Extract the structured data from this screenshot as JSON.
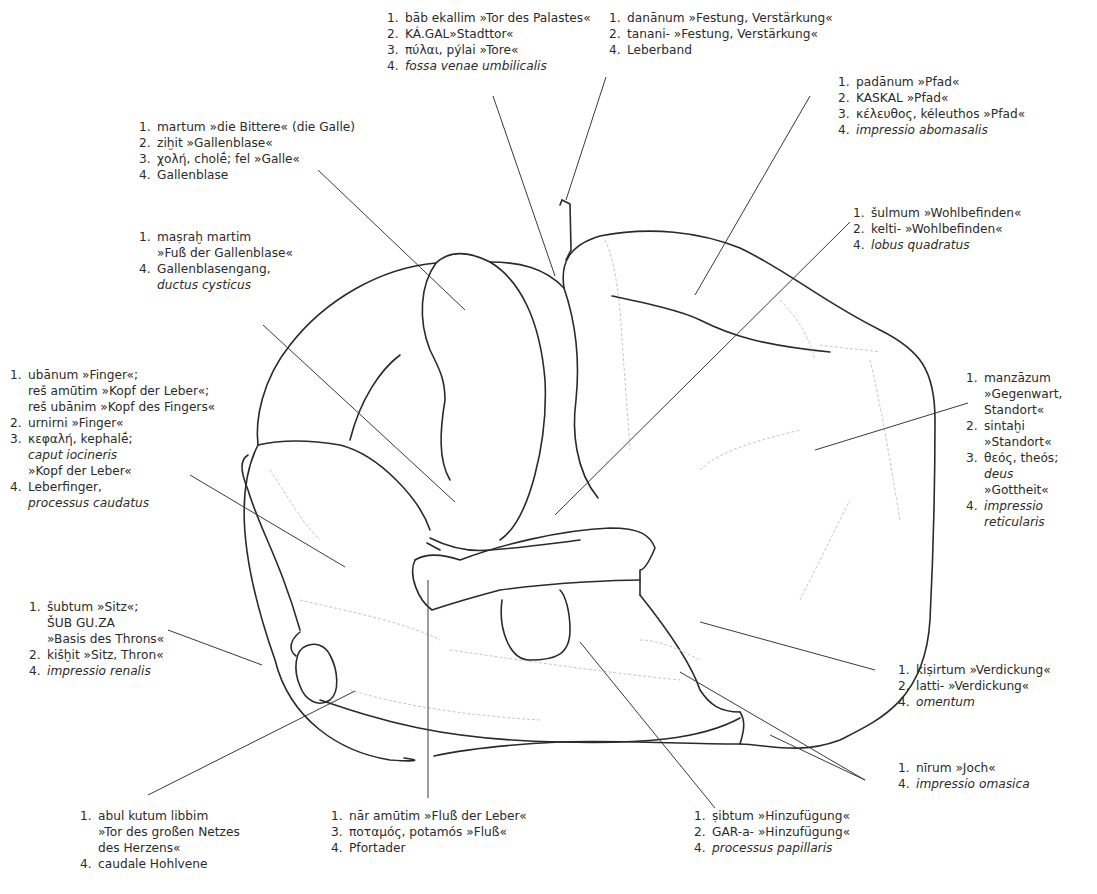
{
  "figure": {
    "line_color": "#2a2a2a",
    "leader_color": "#3a3a3a",
    "faint_color": "#bdbdbd"
  },
  "labels": {
    "tor_des_palastes": {
      "lines": [
        {
          "n": "1.",
          "t": "bāb ekallim »Tor des Palastes«"
        },
        {
          "n": "2.",
          "t": "KÁ.GAL»Stadttor«"
        },
        {
          "n": "3.",
          "t": "πύλαι, pýlai »Tore«"
        },
        {
          "n": "4.",
          "t": "fossa venae umbilicalis",
          "italic": true
        }
      ]
    },
    "festung": {
      "lines": [
        {
          "n": "1.",
          "t": "danānum »Festung, Verstärkung«"
        },
        {
          "n": "2.",
          "t": "tanani- »Festung, Verstärkung«"
        },
        {
          "n": "4.",
          "t": "Leberband"
        }
      ]
    },
    "pfad": {
      "lines": [
        {
          "n": "1.",
          "t": "padānum »Pfad«"
        },
        {
          "n": "2.",
          "t": "KASKAL »Pfad«"
        },
        {
          "n": "3.",
          "t": "κέλευθος, kéleuthos »Pfad«"
        },
        {
          "n": "4.",
          "t": "impressio abomasalis",
          "italic": true
        }
      ]
    },
    "gallenblase": {
      "lines": [
        {
          "n": "1.",
          "t": "martum »die Bittere« (die Galle)"
        },
        {
          "n": "2.",
          "t": "ziḫit »Gallenblase«"
        },
        {
          "n": "3.",
          "t": "χολή, cholḗ; fel »Galle«"
        },
        {
          "n": "4.",
          "t": "Gallenblase"
        }
      ]
    },
    "wohlbefinden": {
      "lines": [
        {
          "n": "1.",
          "t": "šulmum »Wohlbefinden«"
        },
        {
          "n": "2.",
          "t": "kelti- »Wohlbefinden«"
        },
        {
          "n": "4.",
          "t": "lobus quadratus",
          "italic": true
        }
      ]
    },
    "gallenblasengang": {
      "lines": [
        {
          "n": "1.",
          "t": "maṣraḫ martim"
        },
        {
          "n": "",
          "t": "»Fuß der Gallenblase«"
        },
        {
          "n": "4.",
          "t": "Gallenblasengang,"
        },
        {
          "n": "",
          "t": "ductus cysticus",
          "italic": true
        }
      ]
    },
    "finger": {
      "lines": [
        {
          "n": "1.",
          "t": "ubānum »Finger«;"
        },
        {
          "n": "",
          "t": "reš amūtim »Kopf der Leber«;"
        },
        {
          "n": "",
          "t": "reš ubānim »Kopf des Fingers«"
        },
        {
          "n": "2.",
          "t": "urnirni »Finger«"
        },
        {
          "n": "3.",
          "t": "κεφαλή, kephalḗ;"
        },
        {
          "n": "",
          "t": "caput iocineris",
          "italic": true
        },
        {
          "n": "",
          "t": "»Kopf der Leber«"
        },
        {
          "n": "4.",
          "t": "Leberfinger,"
        },
        {
          "n": "",
          "t": "processus caudatus",
          "italic": true
        }
      ]
    },
    "standort": {
      "lines": [
        {
          "n": "1.",
          "t": "manzāzum"
        },
        {
          "n": "",
          "t": "»Gegenwart,"
        },
        {
          "n": "",
          "t": "Standort«"
        },
        {
          "n": "2.",
          "t": "sintaḫi"
        },
        {
          "n": "",
          "t": "»Standort«"
        },
        {
          "n": "3.",
          "t": "θεός, theós;",
          "italic_part": true
        },
        {
          "n": "",
          "t": "deus",
          "italic": true
        },
        {
          "n": "",
          "t": "»Gottheit«"
        },
        {
          "n": "4.",
          "t": "impressio",
          "italic": true
        },
        {
          "n": "",
          "t": "reticularis",
          "italic": true
        }
      ]
    },
    "sitz": {
      "lines": [
        {
          "n": "1.",
          "t": "šubtum »Sitz«;"
        },
        {
          "n": "",
          "t": "ŠUB GU.ZA"
        },
        {
          "n": "",
          "t": "»Basis des Throns«"
        },
        {
          "n": "2.",
          "t": "kišḫit »Sitz, Thron«"
        },
        {
          "n": "4.",
          "t": "impressio renalis",
          "italic": true
        }
      ]
    },
    "verdickung": {
      "lines": [
        {
          "n": "1.",
          "t": "kiṣirtum »Verdickung«"
        },
        {
          "n": "2.",
          "t": "latti- »Verdickung«"
        },
        {
          "n": "4.",
          "t": "omentum",
          "italic": true
        }
      ]
    },
    "joch": {
      "lines": [
        {
          "n": "1.",
          "t": "nīrum »Joch«"
        },
        {
          "n": "4.",
          "t": "impressio omasica",
          "italic": true
        }
      ]
    },
    "netz": {
      "lines": [
        {
          "n": "1.",
          "t": "abul kutum libbim"
        },
        {
          "n": "",
          "t": "»Tor des großen Netzes"
        },
        {
          "n": "",
          "t": "des Herzens«"
        },
        {
          "n": "4.",
          "t": "caudale Hohlvene"
        }
      ]
    },
    "fluss": {
      "lines": [
        {
          "n": "1.",
          "t": "nār amūtim »Fluß der Leber«"
        },
        {
          "n": "3.",
          "t": "ποταμός, potamós  »Fluß«"
        },
        {
          "n": "4.",
          "t": "Pfortader"
        }
      ]
    },
    "hinzufuegung": {
      "lines": [
        {
          "n": "1.",
          "t": "ṣibtum »Hinzufügung«"
        },
        {
          "n": "2.",
          "t": "GAR-a- »Hinzufügung«"
        },
        {
          "n": "4.",
          "t": "processus papillaris",
          "italic": true
        }
      ]
    }
  }
}
